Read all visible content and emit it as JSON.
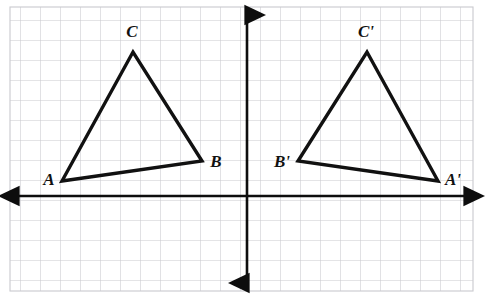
{
  "figure": {
    "background_color": "#ffffff",
    "grid": {
      "name": "graph-paper-grid",
      "line_color": "#c9c9ce",
      "cell_size": 20,
      "left": 10,
      "top": 7,
      "right": 473,
      "bottom": 291,
      "columns": 23,
      "rows": 14
    },
    "axes": {
      "color": "#0d0d0d",
      "stroke_width": 2.6,
      "x_axis": {
        "label": "horizontal-axis",
        "y": 196,
        "x_start": 13,
        "x_end": 470,
        "arrows": "both"
      },
      "y_axis": {
        "label": "vertical-axis",
        "x": 247,
        "y_start": 11,
        "y_end": 287,
        "arrows": "both"
      }
    },
    "shapes": [
      {
        "name": "triangle-abc",
        "stroke_color": "#111111",
        "stroke_width": 3.4,
        "fill": "none",
        "points": "62,181 202,161 133,52",
        "vertices": [
          {
            "id": "A",
            "label": "A",
            "x": 62,
            "y": 181,
            "label_x": 49,
            "label_y": 181
          },
          {
            "id": "B",
            "label": "B",
            "x": 202,
            "y": 161,
            "label_x": 216,
            "label_y": 163
          },
          {
            "id": "C",
            "label": "C",
            "x": 133,
            "y": 52,
            "label_x": 132,
            "label_y": 33
          }
        ]
      },
      {
        "name": "triangle-a-prime-b-prime-c-prime",
        "stroke_color": "#111111",
        "stroke_width": 3.4,
        "fill": "none",
        "points": "438,181 298,161 367,52",
        "vertices": [
          {
            "id": "A'",
            "label": "A'",
            "x": 438,
            "y": 181,
            "label_x": 453,
            "label_y": 181
          },
          {
            "id": "B'",
            "label": "B'",
            "x": 298,
            "y": 161,
            "label_x": 282,
            "label_y": 163
          },
          {
            "id": "C'",
            "label": "C'",
            "x": 367,
            "y": 52,
            "label_x": 366,
            "label_y": 33
          }
        ]
      }
    ],
    "labels": {
      "a": "A",
      "b": "B",
      "c": "C",
      "a_prime": "A'",
      "b_prime": "B'",
      "c_prime": "C'"
    }
  }
}
